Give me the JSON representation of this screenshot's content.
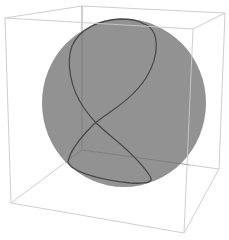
{
  "figure": {
    "colors": {
      "background": "#ffffff",
      "sphere": "#8e8e8e",
      "curve": "#4a4a4a",
      "box": "#c8c8c8"
    },
    "box": {
      "front_top_left": [
        5,
        18
      ],
      "front_top_right": [
        193,
        29
      ],
      "front_bottom_left": [
        11,
        203
      ],
      "front_bottom_right": [
        184,
        233
      ],
      "back_top_left": [
        82,
        6
      ],
      "back_top_right": [
        225,
        13
      ],
      "back_bottom_left": [
        82,
        150
      ],
      "back_bottom_right": [
        219,
        169
      ]
    },
    "sphere": {
      "cx": 124,
      "cy": 103,
      "rx": 82,
      "ry": 84
    }
  }
}
